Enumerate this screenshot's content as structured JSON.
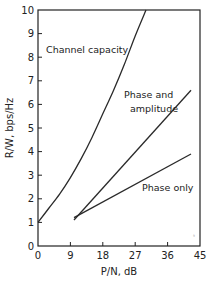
{
  "chart_data": {
    "type": "line",
    "title": "",
    "xlabel": "P/N, dB",
    "ylabel": "R/W, bps/Hz",
    "xlim": [
      0,
      45
    ],
    "ylim": [
      0,
      10
    ],
    "xticks": [
      0,
      9,
      18,
      27,
      36,
      45
    ],
    "yticks": [
      0,
      1,
      2,
      3,
      4,
      5,
      6,
      7,
      8,
      9,
      10
    ],
    "grid": false,
    "legend": "none (inline annotations)",
    "series": [
      {
        "name": "Channel capacity",
        "x": [
          0,
          3,
          6,
          9,
          12,
          15,
          18,
          21,
          24,
          27,
          30
        ],
        "y": [
          1.0,
          1.6,
          2.2,
          2.9,
          3.7,
          4.6,
          5.6,
          6.6,
          7.7,
          8.9,
          10.0
        ]
      },
      {
        "name": "Phase and amplitude",
        "x": [
          10,
          42.5
        ],
        "y": [
          1.1,
          6.6
        ]
      },
      {
        "name": "Phase only",
        "x": [
          10,
          42.5
        ],
        "y": [
          1.2,
          3.9
        ]
      }
    ],
    "annotations": [
      {
        "text": "Channel capacity",
        "x": 2,
        "y": 8.5
      },
      {
        "text": "Phase and amplitude",
        "x": 26,
        "y": 6.3
      },
      {
        "text": "Phase only",
        "x": 30,
        "y": 2.9
      }
    ]
  },
  "labels": {
    "xlabel": "P/N, dB",
    "ylabel": "R/W, bps/Hz",
    "anno_capacity": "Channel capacity",
    "anno_pa_1": "Phase and",
    "anno_pa_2": "amplitude",
    "anno_phase": "Phase only",
    "xt": [
      "0",
      "9",
      "18",
      "27",
      "36",
      "45"
    ],
    "yt": [
      "0",
      "1",
      "2",
      "3",
      "4",
      "5",
      "6",
      "7",
      "8",
      "9",
      "10"
    ]
  }
}
